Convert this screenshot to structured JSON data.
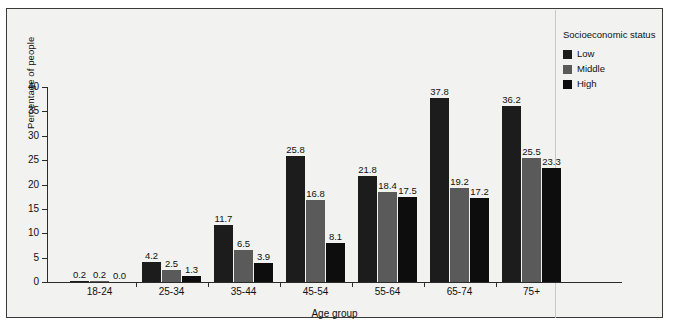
{
  "chart_data": {
    "type": "bar",
    "title": "",
    "xlabel": "Age group",
    "ylabel": "Percentage of people",
    "categories": [
      "18-24",
      "25-34",
      "35-44",
      "45-54",
      "55-64",
      "65-74",
      "75+"
    ],
    "series": [
      {
        "name": "Low",
        "color": "#1c1c1c",
        "values": [
          0.2,
          4.2,
          11.7,
          25.8,
          21.8,
          37.8,
          36.2
        ]
      },
      {
        "name": "Middle",
        "color": "#5a5a5a",
        "values": [
          0.2,
          2.5,
          6.5,
          16.8,
          18.4,
          19.2,
          25.5
        ]
      },
      {
        "name": "High",
        "color": "#0d0d0d",
        "values": [
          0.0,
          1.3,
          3.9,
          8.1,
          17.5,
          17.2,
          23.3
        ]
      }
    ],
    "ylim": [
      0,
      40
    ],
    "yticks": [
      0,
      5,
      10,
      15,
      20,
      25,
      30,
      35,
      40
    ],
    "ytick_labels": [
      "0",
      "5",
      "10",
      "15",
      "20",
      "25",
      "30",
      "35",
      "40"
    ],
    "grid": false,
    "legend": {
      "title": "Socioeconomic status",
      "position": "right",
      "entries": [
        {
          "label": "Low",
          "color": "#1c1c1c"
        },
        {
          "label": "Middle",
          "color": "#5a5a5a"
        },
        {
          "label": "High",
          "color": "#0d0d0d"
        }
      ]
    },
    "data_labels": {
      "18-24": [
        "0.2",
        "0.2",
        "0.0"
      ],
      "25-34": [
        "4.2",
        "2.5",
        "1.3"
      ],
      "35-44": [
        "11.7",
        "6.5",
        "3.9"
      ],
      "45-54": [
        "25.8",
        "16.8",
        "8.1"
      ],
      "55-64": [
        "21.8",
        "18.4",
        "17.5"
      ],
      "65-74": [
        "37.8",
        "19.2",
        "17.2"
      ],
      "75+": [
        "36.2",
        "25.5",
        "23.3"
      ]
    }
  },
  "figure": {
    "background": "#f2f2f0",
    "border_color": "#3a3a3a"
  }
}
